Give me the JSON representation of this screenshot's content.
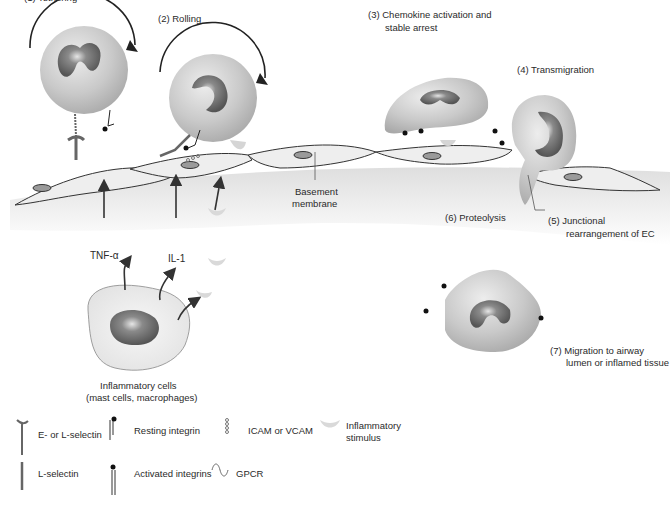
{
  "steps": {
    "s1": "(1) Tethering",
    "s2": "(2)  Rolling",
    "s3_line1": "(3)  Chemokine activation and",
    "s3_line2": "stable arrest",
    "s4": "(4)  Transmigration",
    "s5_line1": "(5)  Junctional",
    "s5_line2": "rearrangement of EC",
    "s6": "(6)  Proteolysis",
    "s7_line1": "(7)  Migration to airway",
    "s7_line2": "lumen or inflamed tissue"
  },
  "annotations": {
    "basement_line1": "Basement",
    "basement_line2": "membrane",
    "tnf": "TNF-α",
    "il1": "IL-1",
    "inflam_line1": "Inflammatory cells",
    "inflam_line2": "(mast cells, macrophages)"
  },
  "legend": {
    "items": [
      {
        "id": "e-l-selectin",
        "label": "E- or L-selectin"
      },
      {
        "id": "resting-integrin",
        "label": "Resting integrin"
      },
      {
        "id": "icam-vcam",
        "label": "ICAM or VCAM"
      },
      {
        "id": "inflammatory-stimulus",
        "label_line1": "Inflammatory",
        "label_line2": "stimulus"
      },
      {
        "id": "l-selectin",
        "label": "L-selectin"
      },
      {
        "id": "activated-integrins",
        "label": "Activated integrins"
      },
      {
        "id": "gpcr",
        "label": "GPCR"
      }
    ]
  },
  "colors": {
    "cell_fill": "#c8c8c8",
    "nucleus": "#6e6e6e",
    "endothelium_fill": "#e8e8e8",
    "outline": "#333333",
    "stimulus": "#d9d9d9"
  }
}
